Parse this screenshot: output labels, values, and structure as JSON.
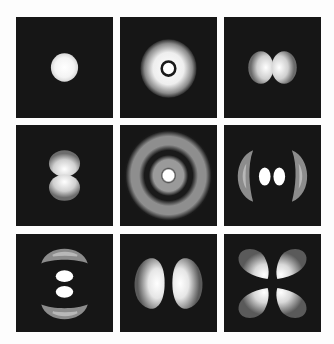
{
  "figure": {
    "background": "#fdfdfd",
    "panel_background": "#161616",
    "layout": {
      "rows": 3,
      "cols": 3
    },
    "panels": [
      {
        "id": "p11",
        "row": 1,
        "col": 1,
        "shape": "single-sphere",
        "x": 16,
        "y": 17,
        "w": 97,
        "h": 101
      },
      {
        "id": "p12",
        "row": 1,
        "col": 2,
        "shape": "sphere-with-inner-node-ring",
        "x": 120,
        "y": 17,
        "w": 97,
        "h": 101
      },
      {
        "id": "p13",
        "row": 1,
        "col": 3,
        "shape": "two-lobes-horizontal",
        "x": 224,
        "y": 17,
        "w": 97,
        "h": 101
      },
      {
        "id": "p21",
        "row": 2,
        "col": 1,
        "shape": "two-lobes-vertical",
        "x": 16,
        "y": 125,
        "w": 97,
        "h": 101
      },
      {
        "id": "p22",
        "row": 2,
        "col": 2,
        "shape": "concentric-rings",
        "x": 120,
        "y": 125,
        "w": 97,
        "h": 101
      },
      {
        "id": "p23",
        "row": 2,
        "col": 3,
        "shape": "two-inner-lobes-with-outer-arcs-horizontal",
        "x": 224,
        "y": 125,
        "w": 97,
        "h": 101
      },
      {
        "id": "p31",
        "row": 3,
        "col": 1,
        "shape": "two-inner-lobes-with-outer-arcs-vertical",
        "x": 16,
        "y": 234,
        "w": 97,
        "h": 98
      },
      {
        "id": "p32",
        "row": 3,
        "col": 2,
        "shape": "two-large-lobes-horizontal",
        "x": 120,
        "y": 234,
        "w": 97,
        "h": 98
      },
      {
        "id": "p33",
        "row": 3,
        "col": 3,
        "shape": "four-lobe-clover",
        "x": 224,
        "y": 234,
        "w": 97,
        "h": 98
      }
    ]
  }
}
